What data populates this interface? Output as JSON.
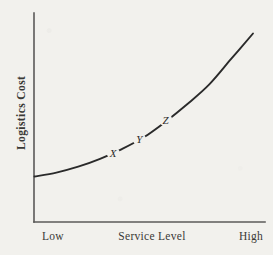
{
  "figure": {
    "background_color": "#f2f1ed",
    "ink_color": "#2a2a2a",
    "axis_color": "#5b5a58"
  },
  "chart_data": {
    "type": "line",
    "title": "",
    "subtitle": "",
    "xlabel": "Service Level",
    "ylabel": "Logistics Cost",
    "xlim": [
      "Low",
      "High"
    ],
    "ylim": [
      0,
      100
    ],
    "grid": false,
    "legend": null,
    "legend_position": "none",
    "x_tick_labels": [
      "Low",
      "High"
    ],
    "y_tick_labels": [],
    "series": [
      {
        "name": "Logistics Cost",
        "description": "Logistics cost rises at an increasing rate as service level increases",
        "x": [
          0,
          10,
          20,
          30,
          40,
          50,
          60,
          70,
          80,
          90,
          100
        ],
        "y": [
          22,
          24,
          27,
          31,
          36,
          42,
          50,
          59,
          69,
          82,
          95
        ]
      }
    ],
    "annotations": [
      {
        "label": "X",
        "x": 36,
        "y": 34,
        "style": "italic"
      },
      {
        "label": "Y",
        "x": 48,
        "y": 41,
        "style": "italic"
      },
      {
        "label": "Z",
        "x": 60,
        "y": 51,
        "style": "italic"
      }
    ]
  },
  "axes": {
    "y_title": "Logistics Cost",
    "x_title": "Service Level",
    "x_low_label": "Low",
    "x_high_label": "High"
  },
  "curve_labels": {
    "x": "X",
    "y": "Y",
    "z": "Z"
  }
}
